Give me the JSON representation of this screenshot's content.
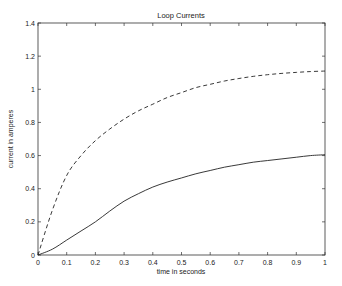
{
  "chart_data": {
    "type": "line",
    "title": "Loop Currents",
    "xlabel": "time in seconds",
    "ylabel": "current in amperes",
    "xlim": [
      0,
      1
    ],
    "ylim": [
      0,
      1.4
    ],
    "grid": false,
    "legend": null,
    "xticks": [
      "0",
      "0.1",
      "0.2",
      "0.3",
      "0.4",
      "0.5",
      "0.6",
      "0.7",
      "0.8",
      "0.9",
      "1"
    ],
    "yticks": [
      "0",
      "0.2",
      "0.4",
      "0.6",
      "0.8",
      "1",
      "1.2",
      "1.4"
    ],
    "x": [
      0,
      0.05,
      0.1,
      0.15,
      0.2,
      0.25,
      0.3,
      0.35,
      0.4,
      0.45,
      0.5,
      0.55,
      0.6,
      0.65,
      0.7,
      0.75,
      0.8,
      0.85,
      0.9,
      0.95,
      1.0
    ],
    "series": [
      {
        "name": "loop current 1",
        "style": "dashed",
        "values": [
          0,
          0.27,
          0.48,
          0.6,
          0.69,
          0.76,
          0.82,
          0.87,
          0.91,
          0.95,
          0.98,
          1.01,
          1.03,
          1.05,
          1.065,
          1.078,
          1.088,
          1.096,
          1.102,
          1.107,
          1.11
        ]
      },
      {
        "name": "loop current 2",
        "style": "solid",
        "values": [
          0,
          0.035,
          0.09,
          0.145,
          0.2,
          0.265,
          0.325,
          0.37,
          0.41,
          0.44,
          0.465,
          0.49,
          0.51,
          0.53,
          0.545,
          0.56,
          0.57,
          0.58,
          0.59,
          0.6,
          0.605
        ]
      }
    ]
  }
}
